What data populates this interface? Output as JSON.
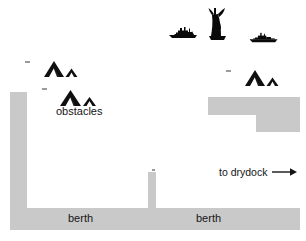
{
  "diagram": {
    "background_color": "#ffffff",
    "quay_color": "#c9c9c9",
    "ink_color": "#000000",
    "labels": {
      "obstacles": "obstacles",
      "berth_left": "berth",
      "berth_right": "berth",
      "drydock": "to drydock",
      "drydock_arrow": "→"
    },
    "structures": [
      {
        "name": "left-quay-wall",
        "x": 10,
        "y": 92,
        "w": 17,
        "h": 122
      },
      {
        "name": "bottom-berth-quay",
        "x": 10,
        "y": 208,
        "w": 290,
        "h": 22
      },
      {
        "name": "center-pier-dolphin",
        "x": 148,
        "y": 172,
        "w": 8,
        "h": 38
      },
      {
        "name": "right-quay-upper",
        "x": 208,
        "y": 97,
        "w": 92,
        "h": 18
      },
      {
        "name": "right-quay-lower",
        "x": 256,
        "y": 115,
        "w": 44,
        "h": 17
      }
    ],
    "vessels": [
      {
        "name": "tug-boat-left",
        "x": 167,
        "y": 24,
        "w": 32,
        "h": 16,
        "kind": "tug"
      },
      {
        "name": "large-vessel-center",
        "x": 204,
        "y": 6,
        "w": 24,
        "h": 36,
        "kind": "sailing-vessel"
      },
      {
        "name": "tug-boat-right",
        "x": 248,
        "y": 30,
        "w": 31,
        "h": 14,
        "kind": "tug"
      }
    ],
    "obstacle_markers": [
      {
        "name": "obstacle-marker-upper-left",
        "x": 42,
        "y": 59,
        "w": 40,
        "h": 20
      },
      {
        "name": "obstacle-marker-lower-left",
        "x": 58,
        "y": 88,
        "w": 42,
        "h": 20
      },
      {
        "name": "obstacle-marker-right",
        "x": 243,
        "y": 68,
        "w": 40,
        "h": 20
      }
    ],
    "tick_marks": [
      {
        "name": "tick-mark-1",
        "x": 25,
        "y": 61,
        "w": 5,
        "h": 2
      },
      {
        "name": "tick-mark-2",
        "x": 42,
        "y": 88,
        "w": 5,
        "h": 2
      },
      {
        "name": "tick-mark-3",
        "x": 226,
        "y": 70,
        "w": 5,
        "h": 2
      },
      {
        "name": "tick-mark-4",
        "x": 152,
        "y": 169,
        "w": 3,
        "h": 2
      }
    ],
    "label_positions": {
      "obstacles": {
        "x": 56,
        "y": 106
      },
      "berth_left": {
        "x": 68,
        "y": 213
      },
      "berth_right": {
        "x": 196,
        "y": 213
      },
      "drydock": {
        "x": 219,
        "y": 166
      }
    }
  }
}
